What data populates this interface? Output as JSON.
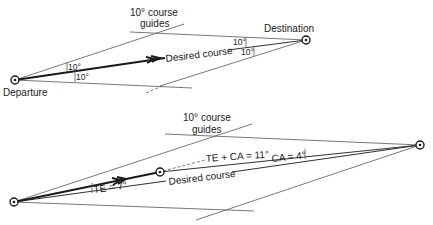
{
  "top_diagram": {
    "guides_label_line1": "10° course",
    "guides_label_line2": "guides",
    "departure_label": "Departure",
    "destination_label": "Destination",
    "desired_course_label": "Desired course",
    "angle_departure_upper": "10°",
    "angle_departure_lower": "10°",
    "angle_destination_upper": "10°",
    "angle_destination_lower": "10°"
  },
  "bottom_diagram": {
    "guides_label_line1": "10° course",
    "guides_label_line2": "guides",
    "desired_course_label": "Desired course",
    "te_label": "TE = 7°",
    "te_ca_label": "TE + CA = 11°",
    "ca_label": "CA = 4°"
  },
  "colors": {
    "line": "#1a1a1a",
    "guide": "#555555",
    "background": "#ffffff"
  }
}
